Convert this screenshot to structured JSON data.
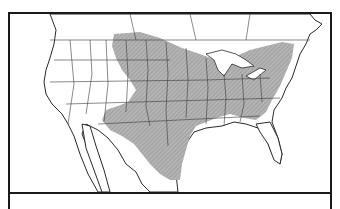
{
  "map": {
    "title": "",
    "region": "North America (United States, southern Canada, northern Mexico)",
    "type": "species range map",
    "colors": {
      "range_fill": "#a9a9a9",
      "border": "#2a2a2a",
      "background": "#ffffff",
      "water": "#ffffff"
    },
    "legend": [
      {
        "label": "Range (shaded)",
        "color": "#a9a9a9"
      }
    ]
  },
  "caption": {
    "text": ""
  }
}
